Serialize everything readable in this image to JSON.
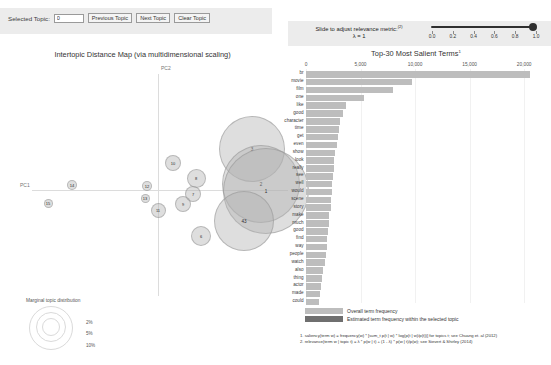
{
  "topic_controls": {
    "selected_topic_label": "Selected Topic:",
    "selected_topic_value": "0",
    "previous_topic": "Previous Topic",
    "next_topic": "Next Topic",
    "clear_topic": "Clear Topic"
  },
  "relevance": {
    "instruction": "Slide to adjust relevance metric:",
    "footnote_marker": "(2)",
    "lambda_text": "λ = 1",
    "value": 1.0,
    "ticks": [
      "0.0",
      "0.2",
      "0.4",
      "0.6",
      "0.8",
      "1.0"
    ]
  },
  "intertopic": {
    "title": "Intertopic Distance Map (via multidimensional scaling)",
    "x_axis_label": "PC1",
    "y_axis_label": "PC2",
    "marginal_legend_title": "Marginal topic distribution",
    "marginal_sizes": [
      "2%",
      "5%",
      "10%"
    ]
  },
  "barchart": {
    "title": "Top-30 Most Salient Terms",
    "title_superscript": "1",
    "legend_overall": "Overall term frequency",
    "legend_topic": "Estimated term frequency within the selected topic",
    "footnote1": "1. saliency(term w) = frequency(w) * [sum_t p(t | w) * log(p(t | w)/p(t))] for topics t; see Chuang et. al (2012)",
    "footnote2": "2. relevance(term w | topic t) = λ * p(w | t) + (1 - λ) * p(w | t)/p(w); see Sievert & Shirley (2014)"
  },
  "colors": {
    "panel_bg": "#ececec",
    "bar_overall": "#bdbdbd",
    "bar_topic": "#7d7d7d",
    "bubble_fill": "rgba(176,176,176,0.42)",
    "axis": "#dcdcdc"
  },
  "chart_data": {
    "type": "bar",
    "title": "Top-30 Most Salient Terms",
    "xlabel": "",
    "ylabel": "",
    "xlim": [
      0,
      22000
    ],
    "orientation": "horizontal",
    "grid": true,
    "legend_position": "bottom-left",
    "tick_values": [
      0,
      5000,
      10000,
      15000,
      20000
    ],
    "tick_labels": [
      "0",
      "5,000",
      "10,000",
      "15,000",
      "20,000"
    ],
    "categories": [
      "br",
      "movie",
      "film",
      "one",
      "like",
      "good",
      "character",
      "time",
      "get",
      "even",
      "show",
      "look",
      "really",
      "see",
      "well",
      "would",
      "scene",
      "story",
      "make",
      "much",
      "good",
      "find",
      "way",
      "people",
      "watch",
      "also",
      "thing",
      "actor",
      "made",
      "could"
    ],
    "series": [
      {
        "name": "Overall term frequency",
        "values": [
          20500,
          9700,
          8000,
          5300,
          3650,
          3350,
          3150,
          3050,
          2950,
          2800,
          2700,
          2600,
          2550,
          2500,
          2400,
          2350,
          2300,
          2250,
          2150,
          2100,
          2050,
          1950,
          1900,
          1800,
          1700,
          1600,
          1500,
          1400,
          1300,
          1200
        ]
      },
      {
        "name": "Estimated term frequency within the selected topic",
        "values": [
          0,
          0,
          0,
          0,
          0,
          0,
          0,
          0,
          0,
          0,
          0,
          0,
          0,
          0,
          0,
          0,
          0,
          0,
          0,
          0,
          0,
          0,
          0,
          0,
          0,
          0,
          0,
          0,
          0,
          0
        ]
      }
    ]
  },
  "topics": [
    {
      "id": "3",
      "x": 242,
      "y": 149,
      "r": 33
    },
    {
      "id": "2",
      "x": 251,
      "y": 184,
      "r": 39
    },
    {
      "id": "1",
      "x": 256,
      "y": 191,
      "r": 43
    },
    {
      "id": "43",
      "x": 234,
      "y": 221,
      "r": 30
    },
    {
      "id": "10",
      "x": 163,
      "y": 163,
      "r": 8
    },
    {
      "id": "8",
      "x": 186,
      "y": 178,
      "r": 9.5
    },
    {
      "id": "7",
      "x": 183,
      "y": 194,
      "r": 8
    },
    {
      "id": "9",
      "x": 173,
      "y": 204,
      "r": 8
    },
    {
      "id": "11",
      "x": 148,
      "y": 210,
      "r": 7.5
    },
    {
      "id": "6",
      "x": 191,
      "y": 236,
      "r": 10
    },
    {
      "id": "12",
      "x": 137,
      "y": 186,
      "r": 5
    },
    {
      "id": "13",
      "x": 135,
      "y": 198,
      "r": 4.5
    },
    {
      "id": "14",
      "x": 62,
      "y": 185,
      "r": 5
    },
    {
      "id": "15",
      "x": 38,
      "y": 203,
      "r": 4.5
    }
  ]
}
